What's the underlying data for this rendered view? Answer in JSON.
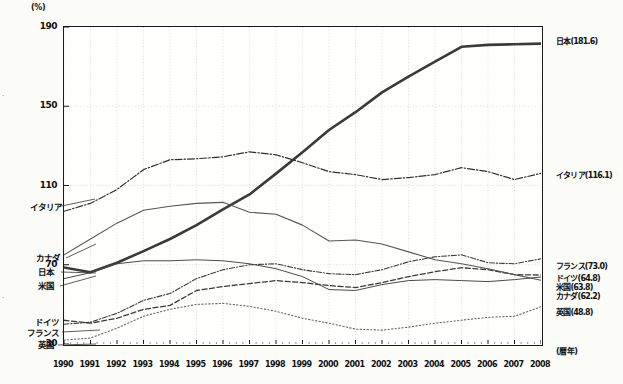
{
  "chart_data": {
    "type": "line",
    "title": "",
    "xlabel": "(暦年)",
    "ylabel": "(%)",
    "ylim": [
      30,
      190
    ],
    "yticks": [
      30,
      70,
      110,
      150,
      190
    ],
    "grid": true,
    "legend_position": "inline-right-and-left",
    "x": [
      1990,
      1991,
      1992,
      1993,
      1994,
      1995,
      1996,
      1997,
      1998,
      1999,
      2000,
      2001,
      2002,
      2003,
      2004,
      2005,
      2006,
      2007,
      2008
    ],
    "xticks": [
      "1990",
      "1991",
      "1992",
      "1993",
      "1994",
      "1995",
      "1996",
      "1997",
      "1998",
      "1999",
      "2000",
      "2001",
      "2002",
      "2003",
      "2004",
      "2005",
      "2006",
      "2007",
      "2008"
    ],
    "series": [
      {
        "name": "日本",
        "left_label": "日本",
        "right_label": "日本(181.6)",
        "final_value": 181.6,
        "style": "solid-thick",
        "color": "#3a3a3a",
        "values": [
          68.6,
          66.2,
          71.0,
          76.9,
          83.0,
          90.0,
          98.0,
          105.5,
          116.0,
          126.8,
          138.0,
          147.0,
          157.0,
          165.0,
          172.5,
          180.0,
          181.0,
          181.3,
          181.6
        ]
      },
      {
        "name": "イタリア",
        "left_label": "イタリア",
        "right_label": "イタリア(116.1)",
        "final_value": 116.1,
        "style": "dash-dot",
        "color": "#2f2f2f",
        "values": [
          97.0,
          101.0,
          108.0,
          118.0,
          123.0,
          123.5,
          124.5,
          127.0,
          125.5,
          121.5,
          117.0,
          115.5,
          113.0,
          114.0,
          115.5,
          119.0,
          117.0,
          113.0,
          116.1
        ]
      },
      {
        "name": "フランス",
        "left_label": "フランス",
        "right_label": "フランス(73.0)",
        "final_value": 73.0,
        "style": "dash-dot-fine",
        "color": "#3a3a3a",
        "values": [
          40.0,
          41.0,
          45.5,
          52.0,
          55.5,
          63.0,
          67.5,
          70.0,
          70.5,
          67.5,
          65.5,
          65.0,
          67.5,
          71.5,
          74.0,
          75.0,
          71.0,
          70.5,
          73.0
        ]
      },
      {
        "name": "ドイツ",
        "left_label": "ドイツ",
        "right_label": "ドイツ(64.8)",
        "final_value": 64.8,
        "style": "dashed",
        "color": "#3a3a3a",
        "values": [
          42.0,
          40.5,
          43.0,
          47.5,
          49.5,
          57.0,
          59.0,
          60.5,
          62.0,
          61.0,
          59.5,
          58.5,
          61.0,
          64.0,
          66.5,
          68.5,
          67.5,
          65.0,
          64.8
        ]
      },
      {
        "name": "米国",
        "left_label": "米国",
        "right_label": "米国(63.8)",
        "final_value": 63.8,
        "style": "solid-thin",
        "color": "#4a4a4a",
        "values": [
          63.0,
          66.0,
          70.5,
          72.0,
          72.0,
          72.5,
          72.0,
          70.5,
          68.0,
          64.0,
          57.5,
          57.0,
          60.0,
          62.0,
          62.5,
          62.0,
          61.5,
          62.5,
          63.8
        ]
      },
      {
        "name": "カナダ",
        "left_label": "カナダ",
        "right_label": "カナダ(62.2)",
        "final_value": 62.2,
        "style": "solid-thin-2",
        "color": "#555555",
        "values": [
          75.0,
          83.0,
          91.0,
          97.5,
          99.5,
          101.0,
          101.5,
          96.5,
          95.5,
          90.0,
          82.0,
          82.5,
          80.5,
          76.5,
          72.5,
          70.5,
          68.0,
          65.0,
          62.2
        ]
      },
      {
        "name": "英国",
        "left_label": "英国",
        "right_label": "英国(48.8)",
        "final_value": 48.8,
        "style": "dotted",
        "color": "#666666",
        "values": [
          32.0,
          33.0,
          38.0,
          44.0,
          47.5,
          50.0,
          50.5,
          49.0,
          46.5,
          43.0,
          40.5,
          37.5,
          37.0,
          38.5,
          40.5,
          42.0,
          43.5,
          44.0,
          48.8
        ]
      }
    ]
  },
  "axis": {
    "unit_y": "(%)",
    "unit_x": "(暦年)",
    "yticks": [
      "190",
      "150",
      "110",
      "70",
      "30"
    ]
  },
  "labels": {
    "left": [
      "イタリア",
      "カナダ",
      "日本",
      "米国",
      "ドイツ",
      "フランス",
      "英国"
    ],
    "right": [
      "日本(181.6)",
      "イタリア(116.1)",
      "フランス(73.0)",
      "ドイツ(64.8)",
      "米国(63.8)",
      "カナダ(62.2)",
      "英国(48.8)"
    ]
  }
}
